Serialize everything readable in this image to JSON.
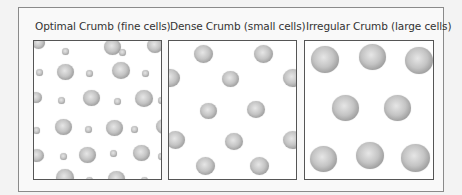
{
  "panels": [
    {
      "title": "Optimal Crumb (fine cells)",
      "box": {
        "left": 33,
        "width": 129
      },
      "bubbles": [
        {
          "x": -2,
          "y": -4,
          "d": 13
        },
        {
          "x": 28,
          "y": 7,
          "d": 7
        },
        {
          "x": 70,
          "y": -2,
          "d": 17
        },
        {
          "x": 85,
          "y": 8,
          "d": 7
        },
        {
          "x": 113,
          "y": -3,
          "d": 16
        },
        {
          "x": 2,
          "y": 28,
          "d": 7
        },
        {
          "x": 23,
          "y": 23,
          "d": 17
        },
        {
          "x": 52,
          "y": 29,
          "d": 7
        },
        {
          "x": 78,
          "y": 21,
          "d": 18
        },
        {
          "x": 108,
          "y": 29,
          "d": 7
        },
        {
          "x": -4,
          "y": 51,
          "d": 12
        },
        {
          "x": 24,
          "y": 56,
          "d": 7
        },
        {
          "x": 49,
          "y": 49,
          "d": 17
        },
        {
          "x": 80,
          "y": 57,
          "d": 7
        },
        {
          "x": 101,
          "y": 49,
          "d": 18
        },
        {
          "x": 124,
          "y": 56,
          "d": 7
        },
        {
          "x": -1,
          "y": 86,
          "d": 7
        },
        {
          "x": 21,
          "y": 78,
          "d": 17
        },
        {
          "x": 51,
          "y": 85,
          "d": 7
        },
        {
          "x": 72,
          "y": 79,
          "d": 17
        },
        {
          "x": 97,
          "y": 85,
          "d": 7
        },
        {
          "x": 122,
          "y": 78,
          "d": 16
        },
        {
          "x": -4,
          "y": 108,
          "d": 14
        },
        {
          "x": 26,
          "y": 112,
          "d": 7
        },
        {
          "x": 45,
          "y": 106,
          "d": 17
        },
        {
          "x": 76,
          "y": 109,
          "d": 7
        },
        {
          "x": 99,
          "y": 104,
          "d": 17
        },
        {
          "x": 124,
          "y": 112,
          "d": 7
        },
        {
          "x": 22,
          "y": 128,
          "d": 18
        },
        {
          "x": 52,
          "y": 136,
          "d": 7
        },
        {
          "x": 74,
          "y": 130,
          "d": 17
        },
        {
          "x": 107,
          "y": 136,
          "d": 7
        }
      ]
    },
    {
      "title": "Dense Crumb (small cells)",
      "box": {
        "left": 168,
        "width": 129
      },
      "bubbles": [
        {
          "x": 25,
          "y": 4,
          "d": 19
        },
        {
          "x": 85,
          "y": 4,
          "d": 19
        },
        {
          "x": -8,
          "y": 28,
          "d": 19
        },
        {
          "x": 53,
          "y": 30,
          "d": 17
        },
        {
          "x": 114,
          "y": 28,
          "d": 19
        },
        {
          "x": 31,
          "y": 62,
          "d": 17
        },
        {
          "x": 78,
          "y": 60,
          "d": 18
        },
        {
          "x": -3,
          "y": 90,
          "d": 19
        },
        {
          "x": 56,
          "y": 92,
          "d": 18
        },
        {
          "x": 114,
          "y": 90,
          "d": 19
        },
        {
          "x": 27,
          "y": 116,
          "d": 19
        },
        {
          "x": 81,
          "y": 116,
          "d": 19
        }
      ]
    },
    {
      "title": "Irregular Crumb (large cells)",
      "box": {
        "left": 304,
        "width": 130
      },
      "bubbles": [
        {
          "x": 6,
          "y": 5,
          "d": 28
        },
        {
          "x": 54,
          "y": 3,
          "d": 27
        },
        {
          "x": 100,
          "y": 6,
          "d": 28
        },
        {
          "x": 27,
          "y": 54,
          "d": 27
        },
        {
          "x": 79,
          "y": 54,
          "d": 27
        },
        {
          "x": 5,
          "y": 105,
          "d": 27
        },
        {
          "x": 51,
          "y": 101,
          "d": 28
        },
        {
          "x": 96,
          "y": 103,
          "d": 29
        }
      ]
    }
  ]
}
